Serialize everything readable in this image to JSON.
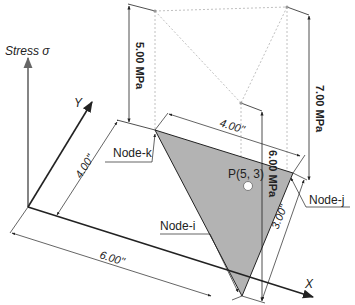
{
  "diagram": {
    "axes": {
      "stress_label": "Stress σ",
      "x_label": "X",
      "y_label": "Y"
    },
    "nodes": [
      {
        "id": "i",
        "label": "Node-i",
        "stress": "6.00 MPa"
      },
      {
        "id": "j",
        "label": "Node-j",
        "stress": "7.00 MPa"
      },
      {
        "id": "k",
        "label": "Node-k",
        "stress": "5.00 MPa"
      }
    ],
    "point": {
      "label": "P(5, 3)"
    },
    "dimensions": {
      "y_offset": "4.00\"",
      "x_offset": "6.00\"",
      "k_to_j": "4.00\"",
      "i_to_j": "3.00\""
    },
    "colors": {
      "element_fill": "#b3b3b3",
      "line": "#222222",
      "dashed": "#aaaaaa",
      "axis_stress": "#666666"
    }
  }
}
